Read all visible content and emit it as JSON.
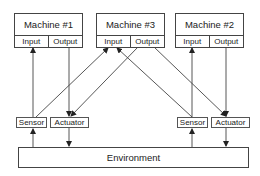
{
  "machines": [
    {
      "id": "m1",
      "title": "Machine #1",
      "input": "Input",
      "output": "Output"
    },
    {
      "id": "m3",
      "title": "Machine #3",
      "input": "Input",
      "output": "Output"
    },
    {
      "id": "m2",
      "title": "Machine #2",
      "input": "Input",
      "output": "Output"
    }
  ],
  "left_group": {
    "sensor": "Sensor",
    "actuator": "Actuator"
  },
  "right_group": {
    "sensor": "Sensor",
    "actuator": "Actuator"
  },
  "environment": "Environment",
  "connections": [
    {
      "from": "left Sensor",
      "to": "Machine #1 Input"
    },
    {
      "from": "Machine #1 Output",
      "to": "left Actuator"
    },
    {
      "from": "left Sensor",
      "to": "Machine #3 Input"
    },
    {
      "from": "Machine #3 Output",
      "to": "left Actuator"
    },
    {
      "from": "right Sensor",
      "to": "Machine #3 Input"
    },
    {
      "from": "Machine #3 Output",
      "to": "right Actuator"
    },
    {
      "from": "right Sensor",
      "to": "Machine #2 Input"
    },
    {
      "from": "Machine #2 Output",
      "to": "right Actuator"
    },
    {
      "from": "Environment",
      "to": "left Sensor"
    },
    {
      "from": "left Actuator",
      "to": "Environment"
    },
    {
      "from": "Environment",
      "to": "right Sensor"
    },
    {
      "from": "right Actuator",
      "to": "Environment"
    }
  ],
  "colors": {
    "line": "#444444",
    "background": "#ffffff"
  }
}
